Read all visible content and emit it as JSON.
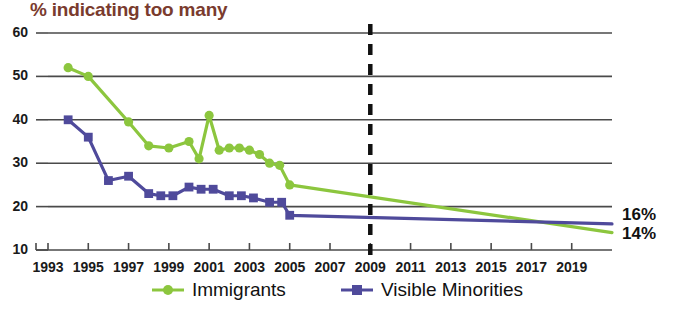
{
  "chart_data": {
    "type": "line",
    "title": "% indicating too many",
    "xlabel": "",
    "ylabel": "",
    "ylim": [
      10,
      60
    ],
    "xlim": [
      1993,
      2021
    ],
    "grid": true,
    "legend_position": "bottom",
    "y_ticks": [
      10,
      20,
      30,
      40,
      50,
      60
    ],
    "x_ticks": [
      1993,
      1995,
      1997,
      1999,
      2001,
      2003,
      2005,
      2007,
      2009,
      2011,
      2013,
      2015,
      2017,
      2019
    ],
    "annotations": [
      {
        "name": "forecast-divider",
        "type": "vertical-dashed-line",
        "x": 2009
      },
      {
        "name": "immigrants-end-label",
        "text": "14%",
        "x": 2021,
        "y": 14,
        "color": "#111111"
      },
      {
        "name": "visible-minorities-end-label",
        "text": "16%",
        "x": 2021,
        "y": 16,
        "color": "#111111"
      }
    ],
    "series": [
      {
        "name": "Immigrants",
        "color": "#8cc63e",
        "marker": "circle",
        "x": [
          1994,
          1995,
          1997,
          1998,
          1999,
          2000,
          2000.5,
          2001,
          2001.5,
          2002,
          2002.5,
          2003,
          2003.5,
          2004,
          2004.5,
          2005,
          2021
        ],
        "values": [
          52,
          50,
          39.5,
          34,
          33.5,
          35,
          31,
          41,
          33,
          33.5,
          33.5,
          33,
          32,
          30,
          29.5,
          25,
          14
        ]
      },
      {
        "name": "Visible Minorities",
        "color": "#4f4a9b",
        "marker": "square",
        "x": [
          1994,
          1995,
          1996,
          1997,
          1998,
          1998.6,
          1999.2,
          2000,
          2000.6,
          2001.2,
          2002,
          2002.6,
          2003.2,
          2004,
          2004.6,
          2005,
          2021
        ],
        "values": [
          40,
          36,
          26,
          27,
          23,
          22.5,
          22.5,
          24.5,
          24,
          24,
          22.5,
          22.5,
          22,
          21,
          21,
          18,
          16
        ]
      }
    ]
  },
  "legend": {
    "items": [
      {
        "label": "Immigrants",
        "color": "#8cc63e",
        "marker": "circle"
      },
      {
        "label": "Visible Minorities",
        "color": "#4f4a9b",
        "marker": "square"
      }
    ]
  },
  "end_labels": {
    "top": "16%",
    "bottom": "14%"
  }
}
